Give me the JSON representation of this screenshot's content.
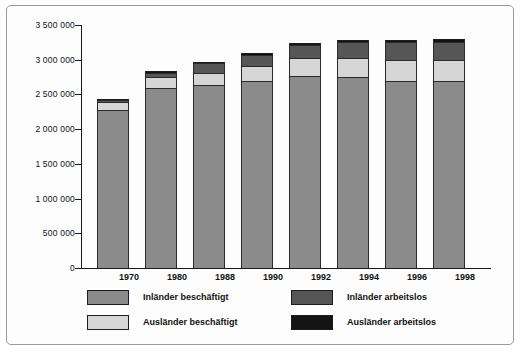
{
  "chart_data": {
    "type": "bar",
    "subtype": "stacked-vertical",
    "title": "",
    "xlabel": "",
    "ylabel": "",
    "categories": [
      "1970",
      "1980",
      "1988",
      "1990",
      "1992",
      "1994",
      "1996",
      "1998"
    ],
    "ylim": [
      0,
      3500000
    ],
    "yticks": [
      0,
      500000,
      1000000,
      1500000,
      2000000,
      2500000,
      3000000,
      3500000
    ],
    "ytick_labels": [
      "0",
      "500 000",
      "1 000 000",
      "1 500 000",
      "2 000 000",
      "2 500 000",
      "3 000 000",
      "3 500 000"
    ],
    "grid": false,
    "legend_position": "bottom",
    "series": [
      {
        "name": "Inländer beschäftigt",
        "color": "#8b8b8b",
        "values": [
          2270000,
          2595000,
          2635000,
          2700000,
          2770000,
          2745000,
          2700000,
          2690000
        ]
      },
      {
        "name": "Ausländer beschäftigt",
        "color": "#d6d6d6",
        "values": [
          115000,
          160000,
          175000,
          215000,
          260000,
          275000,
          290000,
          300000
        ]
      },
      {
        "name": "Inländer arbeitslos",
        "color": "#565656",
        "values": [
          35000,
          60000,
          140000,
          160000,
          180000,
          230000,
          260000,
          270000
        ]
      },
      {
        "name": "Ausländer arbeitslos",
        "color": "#141414",
        "values": [
          10000,
          10000,
          15000,
          20000,
          30000,
          35000,
          35000,
          35000
        ]
      }
    ],
    "totals": [
      2430000,
      2825000,
      2965000,
      3095000,
      3240000,
      3285000,
      3285000,
      3295000
    ]
  },
  "legend": {
    "items": [
      {
        "label": "Inländer beschäftigt",
        "color": "#8b8b8b"
      },
      {
        "label": "Ausländer beschäftigt",
        "color": "#d6d6d6"
      },
      {
        "label": "Inländer arbeitslos",
        "color": "#565656"
      },
      {
        "label": "Ausländer arbeitslos",
        "color": "#141414"
      }
    ]
  }
}
